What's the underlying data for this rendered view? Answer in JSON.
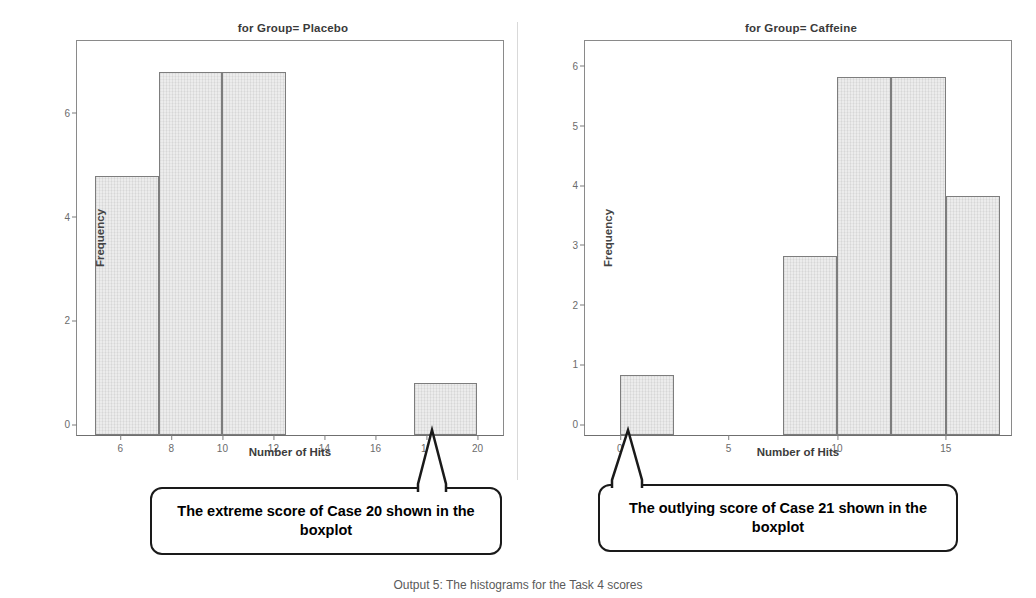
{
  "figure": {
    "caption": "Output 5: The histograms for the Task 4 scores"
  },
  "panels": [
    {
      "id": "placebo",
      "title": "for Group= Placebo",
      "xlabel": "Number of Hits",
      "ylabel": "Frequency"
    },
    {
      "id": "caffeine",
      "title": "for Group= Caffeine",
      "xlabel": "Number of Hits",
      "ylabel": "Frequency"
    }
  ],
  "callouts": [
    {
      "id": "placebo-callout",
      "text": "The extreme score of Case 20 shown in the boxplot"
    },
    {
      "id": "caffeine-callout",
      "text": "The outlying score of Case 21 shown in the boxplot"
    }
  ],
  "chart_data": [
    {
      "type": "bar",
      "title": "for Group= Placebo",
      "xlabel": "Number of Hits",
      "ylabel": "Frequency",
      "xlim": [
        4.3,
        21.0
      ],
      "ylim": [
        0,
        7.6
      ],
      "xticks": [
        6,
        8,
        10,
        12,
        14,
        16,
        18,
        20
      ],
      "yticks": [
        0,
        2,
        4,
        6
      ],
      "grid": false,
      "bin_width": 2.5,
      "bins": [
        {
          "start": 5.0,
          "end": 7.5,
          "count": 5
        },
        {
          "start": 7.5,
          "end": 10.0,
          "count": 7
        },
        {
          "start": 10.0,
          "end": 12.5,
          "count": 7
        },
        {
          "start": 17.5,
          "end": 20.0,
          "count": 1
        }
      ],
      "categories": [
        "5–7.5",
        "7.5–10",
        "10–12.5",
        "17.5–20"
      ],
      "values": [
        5,
        7,
        7,
        1
      ]
    },
    {
      "type": "bar",
      "title": "for Group= Caffeine",
      "xlabel": "Number of Hits",
      "ylabel": "Frequency",
      "xlim": [
        -1.6,
        18.0
      ],
      "ylim": [
        0,
        6.6
      ],
      "xticks": [
        0,
        5,
        10,
        15
      ],
      "yticks": [
        0,
        1,
        2,
        3,
        4,
        5,
        6
      ],
      "grid": false,
      "bin_width": 2.5,
      "bins": [
        {
          "start": 0.0,
          "end": 2.5,
          "count": 1
        },
        {
          "start": 7.5,
          "end": 10.0,
          "count": 3
        },
        {
          "start": 10.0,
          "end": 12.5,
          "count": 6
        },
        {
          "start": 12.5,
          "end": 15.0,
          "count": 6
        },
        {
          "start": 15.0,
          "end": 17.5,
          "count": 4
        }
      ],
      "categories": [
        "0–2.5",
        "7.5–10",
        "10–12.5",
        "12.5–15",
        "15–17.5"
      ],
      "values": [
        1,
        3,
        6,
        6,
        4
      ]
    }
  ]
}
